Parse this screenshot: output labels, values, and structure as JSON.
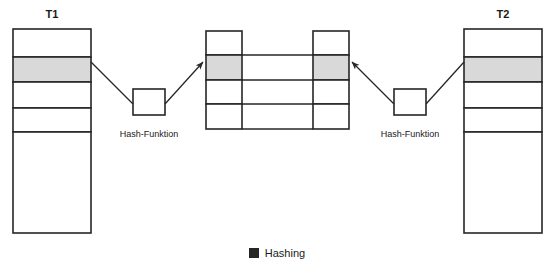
{
  "diagram": {
    "title_left": "T1",
    "title_right": "T2",
    "hash_label_left": "Hash-Funktion",
    "hash_label_right": "Hash-Funktion",
    "legend": {
      "swatch_color": "#262626",
      "label": "Hashing"
    },
    "colors": {
      "stroke": "#262626",
      "fill": "#ffffff",
      "highlight": "#d9d9d9",
      "text": "#1a1a1a"
    },
    "tables": [
      {
        "name": "T1",
        "x": 13,
        "y": 29,
        "width": 78,
        "rows": [
          {
            "height": 28,
            "highlighted": false
          },
          {
            "height": 25,
            "highlighted": true
          },
          {
            "height": 26,
            "highlighted": false
          },
          {
            "height": 24,
            "highlighted": false
          },
          {
            "height": 101,
            "highlighted": false
          }
        ]
      },
      {
        "name": "T2",
        "x": 464,
        "y": 29,
        "width": 78,
        "rows": [
          {
            "height": 28,
            "highlighted": false
          },
          {
            "height": 25,
            "highlighted": true
          },
          {
            "height": 26,
            "highlighted": false
          },
          {
            "height": 24,
            "highlighted": false
          },
          {
            "height": 101,
            "highlighted": false
          }
        ]
      }
    ],
    "buckets": [
      {
        "name": "bucket-left",
        "x": 206,
        "y": 31,
        "width": 36,
        "rows": [
          {
            "height": 24,
            "highlighted": false
          },
          {
            "height": 25,
            "highlighted": true
          },
          {
            "height": 24,
            "highlighted": false
          },
          {
            "height": 25,
            "highlighted": false
          }
        ]
      },
      {
        "name": "bucket-right",
        "x": 313,
        "y": 31,
        "width": 36,
        "rows": [
          {
            "height": 24,
            "highlighted": false
          },
          {
            "height": 25,
            "highlighted": true
          },
          {
            "height": 24,
            "highlighted": false
          },
          {
            "height": 25,
            "highlighted": false
          }
        ]
      }
    ],
    "connectors": [
      {
        "x1": 242,
        "y1": 55,
        "x2": 313,
        "y2": 55
      },
      {
        "x1": 242,
        "y1": 80,
        "x2": 313,
        "y2": 80
      },
      {
        "x1": 242,
        "y1": 104,
        "x2": 313,
        "y2": 104
      },
      {
        "x1": 242,
        "y1": 129,
        "x2": 313,
        "y2": 129
      }
    ],
    "hash_boxes": [
      {
        "name": "hash-box-left",
        "x": 133,
        "y": 89,
        "width": 32,
        "height": 26,
        "label_x": 149,
        "label_y": 129
      },
      {
        "name": "hash-box-right",
        "x": 394,
        "y": 89,
        "width": 32,
        "height": 26,
        "label_x": 410,
        "label_y": 129
      }
    ],
    "arrows": [
      {
        "name": "arrow-t1-to-hash",
        "x1": 91,
        "y1": 62,
        "x2": 133,
        "y2": 104,
        "arrowhead": false
      },
      {
        "name": "arrow-hash-to-bucket-left",
        "x1": 165,
        "y1": 104,
        "x2": 203,
        "y2": 62,
        "arrowhead": true
      },
      {
        "name": "arrow-t2-to-hash",
        "x1": 464,
        "y1": 62,
        "x2": 426,
        "y2": 104,
        "arrowhead": false
      },
      {
        "name": "arrow-hash-to-bucket-right",
        "x1": 394,
        "y1": 104,
        "x2": 352,
        "y2": 62,
        "arrowhead": true
      }
    ]
  }
}
